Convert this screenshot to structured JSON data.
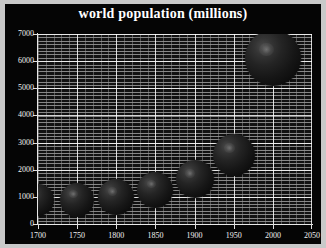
{
  "chart_data": {
    "type": "scatter",
    "title": "world population (millions)",
    "xlabel": "",
    "ylabel": "",
    "xlim": [
      1700,
      2050
    ],
    "ylim": [
      0,
      7000
    ],
    "grid": true,
    "legend": "none",
    "marker_style": "shaded-sphere-bubble",
    "x_ticks": [
      1700,
      1750,
      1800,
      1850,
      1900,
      1950,
      2000,
      2050
    ],
    "x_tick_labels": [
      "1700",
      "1750",
      "1800",
      "1850",
      "1900",
      "1950",
      "2000",
      "2050"
    ],
    "x_minor_tick_step": 10,
    "y_ticks": [
      0,
      1000,
      2000,
      3000,
      4000,
      5000,
      6000,
      7000
    ],
    "y_tick_labels": [
      "0",
      "1000",
      "2000",
      "3000",
      "4000",
      "5000",
      "6000",
      "7000"
    ],
    "x": [
      1700,
      1750,
      1800,
      1850,
      1900,
      1950,
      2000
    ],
    "values": [
      900,
      900,
      980,
      1260,
      1650,
      2550,
      6100
    ],
    "sizes": [
      32,
      34,
      36,
      36,
      38,
      42,
      56
    ],
    "points": [
      {
        "year": 1700,
        "population": 900
      },
      {
        "year": 1750,
        "population": 900
      },
      {
        "year": 1800,
        "population": 980
      },
      {
        "year": 1850,
        "population": 1260
      },
      {
        "year": 1900,
        "population": 1650
      },
      {
        "year": 1950,
        "population": 2550
      },
      {
        "year": 2000,
        "population": 6100
      }
    ],
    "colors": {
      "background": "#050505",
      "frame": "#c9c9c9",
      "plot_background": "#111111",
      "text": "#ffffff",
      "gridline": "#cdcdcd",
      "marker": "#242424",
      "marker_highlight": "#969696"
    }
  }
}
